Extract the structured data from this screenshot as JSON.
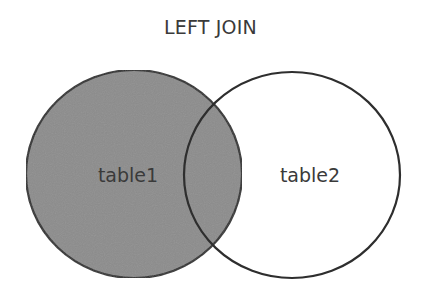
{
  "diagram": {
    "title": "LEFT JOIN",
    "sets": [
      {
        "name": "table1",
        "filled": true
      },
      {
        "name": "table2",
        "filled": false
      }
    ],
    "colors": {
      "fill": "#8c8c8c",
      "stroke": "#2e2e2e",
      "background": "#ffffff",
      "text": "#3a3a3a"
    }
  }
}
